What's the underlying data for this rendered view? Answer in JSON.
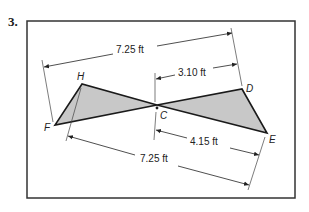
{
  "problem": {
    "number": "3."
  },
  "figure": {
    "fill_color": "#c8c8c8",
    "stroke_color": "#1a1a1a",
    "frame_color": "#333333",
    "vertices": {
      "H": {
        "label": "H",
        "x": 82,
        "y": 84
      },
      "F": {
        "label": "F",
        "x": 55,
        "y": 125
      },
      "C": {
        "label": "C",
        "x": 157,
        "y": 105
      },
      "D": {
        "label": "D",
        "x": 242,
        "y": 89
      },
      "E": {
        "label": "E",
        "x": 267,
        "y": 133
      }
    },
    "triangles": [
      {
        "name": "triangle-HFC",
        "points": [
          "H",
          "F",
          "C"
        ]
      },
      {
        "name": "triangle-CDE",
        "points": [
          "C",
          "D",
          "E"
        ]
      }
    ],
    "dimensions": {
      "top_HD": {
        "label": "7.25 ft"
      },
      "CD": {
        "label": "3.10 ft"
      },
      "CE": {
        "label": "4.15 ft"
      },
      "bottom_FE": {
        "label": "7.25 ft"
      }
    }
  }
}
